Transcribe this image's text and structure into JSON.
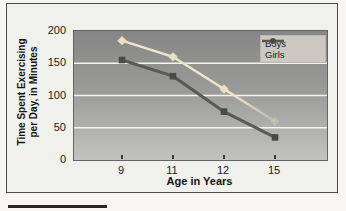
{
  "figure": {
    "background": "#f0f0ec",
    "border_color": "#4e4e4e"
  },
  "chart_data": {
    "type": "line",
    "title": "",
    "categories": [
      "9",
      "11",
      "12",
      "15"
    ],
    "series": [
      {
        "name": "Boys",
        "values": [
          185,
          160,
          110,
          60
        ],
        "color": "#ece7c6",
        "marker": "diamond",
        "marker_color": "#e8e2bd",
        "fade_end": true
      },
      {
        "name": "Girls",
        "values": [
          155,
          130,
          75,
          35
        ],
        "color": "#5c5955",
        "marker": "square",
        "marker_color": "#4c4945"
      }
    ],
    "xlabel": "Age in Years",
    "ylabel_lines": [
      "Time Spent Exercising",
      "per Day, in Minutes"
    ],
    "ylim": [
      0,
      200
    ],
    "yticks": [
      0,
      50,
      100,
      150,
      200
    ],
    "gridlines": [
      50,
      100,
      150
    ],
    "grid_color": "#f4f3ef",
    "plot_bg_top": "#868686",
    "plot_bg_bottom": "#c2c2bf",
    "legend": {
      "position": "top-right",
      "background": "#cbc9c2"
    }
  }
}
